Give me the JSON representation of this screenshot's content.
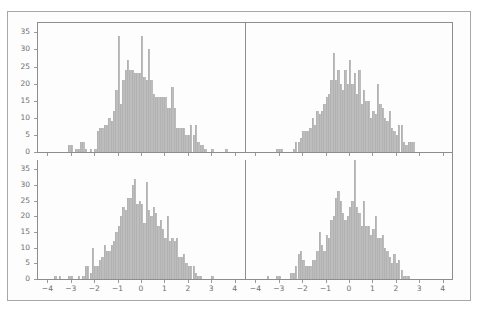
{
  "figure": {
    "width": 479,
    "height": 313,
    "background_color": "#ffffff",
    "frame_color": "#a8a8a8",
    "bar_color": "#bdbdbd",
    "axis_color": "#8d8d8d",
    "tick_text_color": "#6d6d6d",
    "layout": "2x2 grid of histograms sharing axes"
  },
  "chart_data": [
    {
      "type": "bar",
      "subplot": "top-left",
      "title": "",
      "xlabel": "",
      "ylabel": "",
      "xlim": [
        -4.4,
        4.4
      ],
      "ylim": [
        0,
        38
      ],
      "grid": false,
      "legend": null,
      "xticks": [
        -4,
        -3,
        -2,
        -1,
        0,
        1,
        2,
        3,
        4
      ],
      "yticks": [
        0,
        5,
        10,
        15,
        20,
        25,
        30,
        35
      ],
      "bin_width": 0.1,
      "bin_starts": [
        -3.2,
        -3.1,
        -3.0,
        -2.9,
        -2.8,
        -2.7,
        -2.6,
        -2.5,
        -2.4,
        -2.3,
        -2.2,
        -2.1,
        -2.0,
        -1.9,
        -1.8,
        -1.7,
        -1.6,
        -1.5,
        -1.4,
        -1.3,
        -1.2,
        -1.1,
        -1.0,
        -0.9,
        -0.8,
        -0.7,
        -0.6,
        -0.5,
        -0.4,
        -0.3,
        -0.2,
        -0.1,
        0.0,
        0.1,
        0.2,
        0.3,
        0.4,
        0.5,
        0.6,
        0.7,
        0.8,
        0.9,
        1.0,
        1.1,
        1.2,
        1.3,
        1.4,
        1.5,
        1.6,
        1.7,
        1.8,
        1.9,
        2.0,
        2.1,
        2.2,
        2.3,
        2.4,
        2.5,
        2.6,
        2.7,
        2.8,
        2.9,
        3.0,
        3.1,
        3.2,
        3.3,
        3.4,
        3.5,
        3.6,
        3.7,
        3.8
      ],
      "values": [
        0,
        2,
        2,
        0,
        1,
        1,
        3,
        3,
        1,
        0,
        1,
        0,
        1,
        6,
        7,
        7,
        8,
        8,
        10,
        9,
        12,
        18,
        34,
        14,
        21,
        24,
        27,
        24,
        24,
        23,
        23,
        23,
        34,
        22,
        21,
        30,
        21,
        17,
        16,
        16,
        16,
        16,
        16,
        13,
        13,
        19,
        13,
        7,
        7,
        7,
        7,
        5,
        5,
        8,
        5,
        8,
        3,
        2,
        2,
        1,
        0,
        0,
        1,
        0,
        0,
        0,
        0,
        0,
        1,
        0,
        0
      ]
    },
    {
      "type": "bar",
      "subplot": "top-right",
      "title": "",
      "xlabel": "",
      "ylabel": "",
      "xlim": [
        -4.4,
        4.4
      ],
      "ylim": [
        0,
        38
      ],
      "grid": false,
      "legend": null,
      "xticks": [
        -4,
        -3,
        -2,
        -1,
        0,
        1,
        2,
        3,
        4
      ],
      "yticks": [
        0,
        5,
        10,
        15,
        20,
        25,
        30,
        35
      ],
      "bin_width": 0.1,
      "bin_starts": [
        -3.1,
        -3.0,
        -2.9,
        -2.8,
        -2.7,
        -2.6,
        -2.5,
        -2.4,
        -2.3,
        -2.2,
        -2.1,
        -2.0,
        -1.9,
        -1.8,
        -1.7,
        -1.6,
        -1.5,
        -1.4,
        -1.3,
        -1.2,
        -1.1,
        -1.0,
        -0.9,
        -0.8,
        -0.7,
        -0.6,
        -0.5,
        -0.4,
        -0.3,
        -0.2,
        -0.1,
        0.0,
        0.1,
        0.2,
        0.3,
        0.4,
        0.5,
        0.6,
        0.7,
        0.8,
        0.9,
        1.0,
        1.1,
        1.2,
        1.3,
        1.4,
        1.5,
        1.6,
        1.7,
        1.8,
        1.9,
        2.0,
        2.1,
        2.2,
        2.3,
        2.4,
        2.5,
        2.6,
        2.7
      ],
      "values": [
        1,
        1,
        1,
        0,
        0,
        0,
        0,
        1,
        3,
        3,
        4,
        6,
        6,
        6,
        7,
        10,
        8,
        12,
        11,
        12,
        14,
        16,
        17,
        21,
        29,
        21,
        24,
        20,
        18,
        24,
        20,
        27,
        20,
        23,
        17,
        24,
        14,
        18,
        15,
        15,
        10,
        12,
        11,
        20,
        14,
        13,
        10,
        9,
        12,
        7,
        6,
        5,
        8,
        8,
        3,
        2,
        3,
        3,
        3
      ]
    },
    {
      "type": "bar",
      "subplot": "bottom-left",
      "title": "",
      "xlabel": "",
      "ylabel": "",
      "xlim": [
        -4.4,
        4.4
      ],
      "ylim": [
        0,
        38
      ],
      "grid": false,
      "legend": null,
      "xticks": [
        -4,
        -3,
        -2,
        -1,
        0,
        1,
        2,
        3,
        4
      ],
      "yticks": [
        0,
        5,
        10,
        15,
        20,
        25,
        30,
        35
      ],
      "bin_width": 0.1,
      "bin_starts": [
        -3.7,
        -3.6,
        -3.5,
        -3.4,
        -3.3,
        -3.2,
        -3.1,
        -3.0,
        -2.9,
        -2.8,
        -2.7,
        -2.6,
        -2.5,
        -2.4,
        -2.3,
        -2.2,
        -2.1,
        -2.0,
        -1.9,
        -1.8,
        -1.7,
        -1.6,
        -1.5,
        -1.4,
        -1.3,
        -1.2,
        -1.1,
        -1.0,
        -0.9,
        -0.8,
        -0.7,
        -0.6,
        -0.5,
        -0.4,
        -0.3,
        -0.2,
        -0.1,
        0.0,
        0.1,
        0.2,
        0.3,
        0.4,
        0.5,
        0.6,
        0.7,
        0.8,
        0.9,
        1.0,
        1.1,
        1.2,
        1.3,
        1.4,
        1.5,
        1.6,
        1.7,
        1.8,
        1.9,
        2.0,
        2.1,
        2.2,
        2.3,
        2.4,
        2.5,
        2.6,
        2.7,
        2.8,
        2.9,
        3.0,
        3.1
      ],
      "values": [
        1,
        0,
        1,
        0,
        0,
        0,
        1,
        1,
        0,
        0,
        1,
        0,
        1,
        4,
        4,
        2,
        10,
        4,
        4,
        6,
        7,
        11,
        9,
        9,
        11,
        12,
        15,
        17,
        20,
        23,
        22,
        26,
        26,
        30,
        32,
        24,
        25,
        24,
        18,
        31,
        22,
        20,
        23,
        21,
        17,
        19,
        16,
        13,
        20,
        12,
        13,
        12,
        13,
        7,
        7,
        8,
        5,
        4,
        4,
        4,
        2,
        1,
        1,
        0,
        0,
        0,
        0,
        1,
        0
      ]
    },
    {
      "type": "bar",
      "subplot": "bottom-right",
      "title": "",
      "xlabel": "",
      "ylabel": "",
      "xlim": [
        -4.4,
        4.4
      ],
      "ylim": [
        0,
        38
      ],
      "grid": false,
      "legend": null,
      "xticks": [
        -4,
        -3,
        -2,
        -1,
        0,
        1,
        2,
        3,
        4
      ],
      "yticks": [
        0,
        5,
        10,
        15,
        20,
        25,
        30,
        35
      ],
      "bin_width": 0.1,
      "bin_starts": [
        -3.9,
        -3.8,
        -3.7,
        -3.6,
        -3.5,
        -3.4,
        -3.3,
        -3.2,
        -3.1,
        -3.0,
        -2.9,
        -2.8,
        -2.7,
        -2.6,
        -2.5,
        -2.4,
        -2.3,
        -2.2,
        -2.1,
        -2.0,
        -1.9,
        -1.8,
        -1.7,
        -1.6,
        -1.5,
        -1.4,
        -1.3,
        -1.2,
        -1.1,
        -1.0,
        -0.9,
        -0.8,
        -0.7,
        -0.6,
        -0.5,
        -0.4,
        -0.3,
        -0.2,
        -0.1,
        0.0,
        0.1,
        0.2,
        0.3,
        0.4,
        0.5,
        0.6,
        0.7,
        0.8,
        0.9,
        1.0,
        1.1,
        1.2,
        1.3,
        1.4,
        1.5,
        1.6,
        1.7,
        1.8,
        1.9,
        2.0,
        2.1,
        2.2,
        2.3,
        2.4,
        2.5
      ],
      "values": [
        0,
        0,
        0,
        0,
        1,
        0,
        0,
        0,
        1,
        1,
        0,
        0,
        0,
        0,
        2,
        2,
        4,
        8,
        9,
        6,
        4,
        4,
        4,
        6,
        6,
        9,
        15,
        11,
        9,
        14,
        13,
        19,
        20,
        26,
        28,
        25,
        21,
        19,
        20,
        23,
        25,
        38,
        23,
        21,
        17,
        25,
        17,
        17,
        14,
        16,
        20,
        13,
        13,
        14,
        10,
        9,
        7,
        5,
        8,
        5,
        6,
        3,
        1,
        1,
        1
      ]
    }
  ],
  "axes": {
    "y_tick_labels_top_left": [
      "35",
      "30",
      "25",
      "20",
      "15",
      "10",
      "5",
      "0"
    ],
    "y_tick_labels_bottom_left": [
      "35",
      "30",
      "25",
      "20",
      "15",
      "10",
      "5",
      "0"
    ],
    "x_tick_labels_bottom_left": [
      "-4",
      "-3",
      "-2",
      "-1",
      "0",
      "1",
      "2",
      "3",
      "4"
    ],
    "x_tick_labels_bottom_right": [
      "-4",
      "-3",
      "-2",
      "-1",
      "0",
      "1",
      "2",
      "3",
      "4"
    ]
  }
}
